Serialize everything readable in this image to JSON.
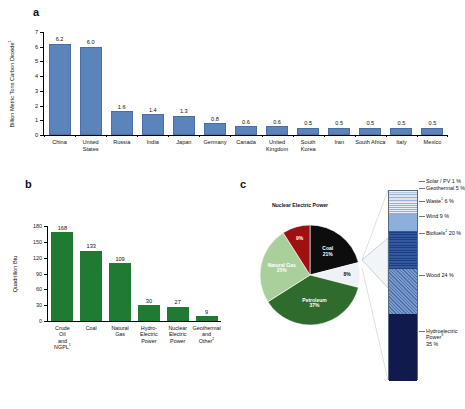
{
  "panels": {
    "a": {
      "letter": "a",
      "ylabel": "Billion Metric Tons Carbon Dioxide",
      "ylabel_sup": "1",
      "yticks": [
        "0",
        "1",
        "2",
        "3",
        "4",
        "5",
        "6",
        "7"
      ]
    },
    "b": {
      "letter": "b",
      "ylabel": "Quadrillion Btu",
      "yticks": [
        "0",
        "30",
        "60",
        "90",
        "120",
        "150",
        "180"
      ]
    },
    "c": {
      "letter": "c",
      "pie_title": "Nuclear Electric Power",
      "callout": "Renewable Energy"
    }
  },
  "chart_data": [
    {
      "type": "bar",
      "panel": "a",
      "title": "",
      "xlabel": "",
      "ylabel": "Billion Metric Tons Carbon Dioxide",
      "ylim": [
        0,
        7
      ],
      "yticks": [
        0,
        1,
        2,
        3,
        4,
        5,
        6,
        7
      ],
      "grid": false,
      "color": "#5b84bd",
      "categories": [
        "China",
        "United States",
        "Russia",
        "India",
        "Japan",
        "Germany",
        "Canada",
        "United Kingdom",
        "South Korea",
        "Iran",
        "South Africa",
        "Italy",
        "Mexico"
      ],
      "values": [
        6.2,
        6.0,
        1.6,
        1.4,
        1.3,
        0.8,
        0.6,
        0.6,
        0.5,
        0.5,
        0.5,
        0.5,
        0.5
      ],
      "value_labels": [
        "6.2",
        "6.0",
        "1.6",
        "1.4",
        "1.3",
        "0.8",
        "0.6",
        "0.6",
        "0.5",
        "0.5",
        "0.5",
        "0.5",
        "0.5"
      ]
    },
    {
      "type": "bar",
      "panel": "b",
      "title": "",
      "xlabel": "",
      "ylabel": "Quadrillion Btu",
      "ylim": [
        0,
        180
      ],
      "yticks": [
        0,
        30,
        60,
        90,
        120,
        150,
        180
      ],
      "grid": false,
      "color": "#1f7a32",
      "categories": [
        "Crude Oil and NGPL",
        "Coal",
        "Natural Gas",
        "Hydro-Electric Power",
        "Nuclear Electric Power",
        "Geothermal and Other"
      ],
      "category_sups": [
        "1",
        "",
        "",
        "",
        "",
        "2"
      ],
      "values": [
        168,
        133,
        109,
        30,
        27,
        9
      ],
      "value_labels": [
        "168",
        "133",
        "109",
        "30",
        "27",
        "9"
      ]
    },
    {
      "type": "pie",
      "panel": "c",
      "title": "",
      "labels": [
        "Coal",
        "Renewable Energy",
        "Petroleum",
        "Natural Gas",
        "Nuclear Electric Power"
      ],
      "values": [
        21,
        8,
        37,
        25,
        9
      ],
      "value_labels": [
        "21%",
        "8%",
        "37%",
        "25%",
        "9%"
      ],
      "colors": [
        "#0d0d0d",
        "#eef2f6",
        "#2f6b2c",
        "#a9cf9a",
        "#a01010"
      ]
    },
    {
      "type": "bar",
      "panel": "c-stack",
      "title": "Renewable Energy",
      "orientation": "stacked-vertical",
      "labels": [
        "Solar / PV",
        "Geothermal",
        "Waste",
        "Wind",
        "Biofuels",
        "Wood",
        "Hydroelectric Power"
      ],
      "label_sups": [
        "",
        "",
        "1",
        "",
        "2",
        "",
        "3"
      ],
      "values": [
        1,
        5,
        6,
        9,
        20,
        24,
        35
      ],
      "value_labels": [
        "1 %",
        "5 %",
        "6 %",
        "9 %",
        "20 %",
        "24 %",
        "35 %"
      ],
      "colors": [
        "#d9e4f0",
        "#c3d4e8",
        "#cddcee",
        "#8cb0dc",
        "#2c55a0",
        "#5f84bd",
        "#101a4d"
      ]
    }
  ],
  "a_series": {
    "items": [
      {
        "label": "China",
        "value": "6.2",
        "num": 6.2
      },
      {
        "label": "United States",
        "value": "6.0",
        "num": 6.0
      },
      {
        "label": "Russia",
        "value": "1.6",
        "num": 1.6
      },
      {
        "label": "India",
        "value": "1.4",
        "num": 1.4
      },
      {
        "label": "Japan",
        "value": "1.3",
        "num": 1.3
      },
      {
        "label": "Germany",
        "value": "0.8",
        "num": 0.8
      },
      {
        "label": "Canada",
        "value": "0.6",
        "num": 0.6
      },
      {
        "label": "United Kingdom",
        "value": "0.6",
        "num": 0.6
      },
      {
        "label": "South Korea",
        "value": "0.5",
        "num": 0.5
      },
      {
        "label": "Iran",
        "value": "0.5",
        "num": 0.5
      },
      {
        "label": "South Africa",
        "value": "0.5",
        "num": 0.5
      },
      {
        "label": "Italy",
        "value": "0.5",
        "num": 0.5
      },
      {
        "label": "Mexico",
        "value": "0.5",
        "num": 0.5
      }
    ]
  },
  "b_series": {
    "items": [
      {
        "label": "Crude Oil and NGPL",
        "sup": "1",
        "value": "168",
        "num": 168
      },
      {
        "label": "Coal",
        "sup": "",
        "value": "133",
        "num": 133
      },
      {
        "label": "Natural Gas",
        "sup": "",
        "value": "109",
        "num": 109
      },
      {
        "label": "Hydro-Electric Power",
        "sup": "",
        "value": "30",
        "num": 30
      },
      {
        "label": "Nuclear Electric Power",
        "sup": "",
        "value": "27",
        "num": 27
      },
      {
        "label": "Geothermal and Other",
        "sup": "2",
        "value": "9",
        "num": 9
      }
    ]
  },
  "pie_slices": [
    {
      "name": "Coal",
      "pct": "21%",
      "value": 21,
      "color": "#0d0d0d",
      "text_color": "#ffffff"
    },
    {
      "name": "Renewable Energy",
      "pct": "8%",
      "value": 8,
      "color": "#eef2f6",
      "text_color": "#111111"
    },
    {
      "name": "Petroleum",
      "pct": "37%",
      "value": 37,
      "color": "#2f6b2c",
      "text_color": "#ffffff"
    },
    {
      "name": "Natural Gas",
      "pct": "25%",
      "value": 25,
      "color": "#a9cf9a",
      "text_color": "#ffffff"
    },
    {
      "name": "Nuclear Electric Power",
      "pct": "9%",
      "value": 9,
      "color": "#a01010",
      "text_color": "#ffffff"
    }
  ],
  "stack_items": [
    {
      "label": "Solar / PV",
      "sup": "",
      "pct": "1 %",
      "value": 1,
      "color": "#d9e4f0"
    },
    {
      "label": "Geothermal",
      "sup": "",
      "pct": "5 %",
      "value": 5,
      "color": "#c6d6ea"
    },
    {
      "label": "Waste",
      "sup": "1",
      "pct": "6 %",
      "value": 6,
      "color": "#cfdcee"
    },
    {
      "label": "Wind",
      "sup": "",
      "pct": "9 %",
      "value": 9,
      "color": "#8cb0dc"
    },
    {
      "label": "Biofuels",
      "sup": "2",
      "pct": "20 %",
      "value": 20,
      "color": "#2c55a0"
    },
    {
      "label": "Wood",
      "sup": "",
      "pct": "24 %",
      "value": 24,
      "color": "#5f84bd"
    },
    {
      "label": "Hydroelectric Power",
      "sup": "3",
      "pct": "35 %",
      "value": 35,
      "color": "#101a4d"
    }
  ]
}
